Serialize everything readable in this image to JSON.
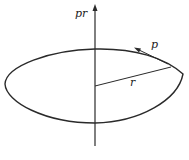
{
  "diagram": {
    "axis_label": "pr",
    "radius_label": "r",
    "momentum_label": "p",
    "stroke_color": "#2a2a2a",
    "background": "#ffffff"
  }
}
